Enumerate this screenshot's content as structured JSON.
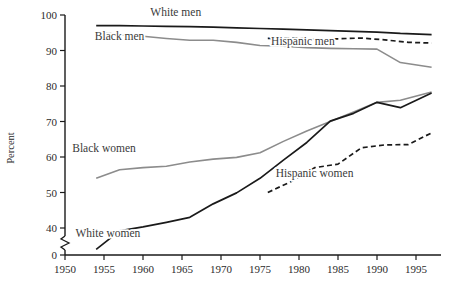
{
  "chart_data": {
    "type": "line",
    "title": "",
    "xlabel": "",
    "ylabel": "Percent",
    "xlim": [
      1947,
      1998
    ],
    "ylim": [
      0,
      100
    ],
    "xticks": [
      1950,
      1955,
      1960,
      1965,
      1970,
      1975,
      1980,
      1985,
      1990,
      1995
    ],
    "xtick_labels": [
      "1950",
      "1955",
      "1960",
      "1965",
      "1970",
      "1975",
      "1980",
      "1985",
      "1990",
      "1995"
    ],
    "yticks": [
      0,
      40,
      50,
      60,
      70,
      80,
      90,
      100
    ],
    "ytick_labels": [
      "0",
      "40",
      "50",
      "60",
      "70",
      "80",
      "90",
      "100"
    ],
    "y_axis_break": true,
    "y_axis_break_between": [
      0,
      40
    ],
    "grid": false,
    "legend_position": "inline-labels",
    "series": [
      {
        "name": "White men",
        "style": "solid",
        "color": "#1a1a1a",
        "width": 1.7,
        "label_x": 1964.2,
        "label_y": 99.6,
        "x": [
          1954,
          1957,
          1960,
          1963,
          1966,
          1969,
          1972,
          1975,
          1978,
          1981,
          1984,
          1987,
          1990,
          1993,
          1997
        ],
        "values": [
          97.0,
          97.0,
          96.9,
          96.8,
          96.7,
          96.6,
          96.4,
          96.2,
          96.0,
          95.8,
          95.6,
          95.4,
          95.2,
          94.8,
          94.5
        ]
      },
      {
        "name": "Black men",
        "style": "solid",
        "color": "#8c8c8c",
        "width": 1.6,
        "label_x": 1957.0,
        "label_y": 93.0,
        "x": [
          1954,
          1957,
          1960,
          1963,
          1966,
          1969,
          1972,
          1975,
          1978,
          1981,
          1984,
          1987,
          1990,
          1993,
          1997
        ],
        "values": [
          95.2,
          94.5,
          94.0,
          93.4,
          92.9,
          92.9,
          92.3,
          91.4,
          91.2,
          90.8,
          90.6,
          90.5,
          90.4,
          86.6,
          85.3
        ]
      },
      {
        "name": "Hispanic men",
        "style": "dashed",
        "color": "#1a1a1a",
        "width": 1.7,
        "label_x": 1980.5,
        "label_y": 91.5,
        "x": [
          1976,
          1979,
          1982,
          1985,
          1988,
          1991,
          1994,
          1997
        ],
        "values": [
          93.4,
          93.6,
          93.2,
          93.3,
          93.5,
          93.0,
          92.3,
          92.1
        ]
      },
      {
        "name": "Black women",
        "style": "solid",
        "color": "#8c8c8c",
        "width": 1.6,
        "label_x": 1955.0,
        "label_y": 61.5,
        "x": [
          1954,
          1957,
          1960,
          1963,
          1966,
          1969,
          1972,
          1975,
          1978,
          1981,
          1984,
          1987,
          1990,
          1993,
          1997
        ],
        "values": [
          54.0,
          56.4,
          57.0,
          57.4,
          58.6,
          59.4,
          59.9,
          61.2,
          64.4,
          67.3,
          70.0,
          72.7,
          75.4,
          76.0,
          78.3
        ]
      },
      {
        "name": "White women",
        "style": "solid",
        "color": "#1a1a1a",
        "width": 1.7,
        "label_x": 1955.5,
        "label_y": 37.5,
        "x": [
          1954,
          1957,
          1960,
          1963,
          1966,
          1969,
          1972,
          1975,
          1978,
          1981,
          1984,
          1987,
          1990,
          1993,
          1997
        ],
        "values": [
          34.0,
          39.2,
          40.3,
          41.6,
          43.0,
          46.8,
          49.9,
          54.0,
          59.1,
          64.1,
          70.1,
          72.3,
          75.4,
          73.9,
          78.0
        ]
      },
      {
        "name": "Hispanic women",
        "style": "dashed",
        "color": "#1a1a1a",
        "width": 1.7,
        "label_x": 1982.0,
        "label_y": 54.5,
        "x": [
          1976,
          1979,
          1982,
          1985,
          1988,
          1991,
          1994,
          1997
        ],
        "values": [
          50.0,
          53.1,
          57.0,
          58.0,
          62.6,
          63.4,
          63.5,
          66.8
        ]
      }
    ]
  },
  "axis": {
    "y_title": "Percent"
  }
}
